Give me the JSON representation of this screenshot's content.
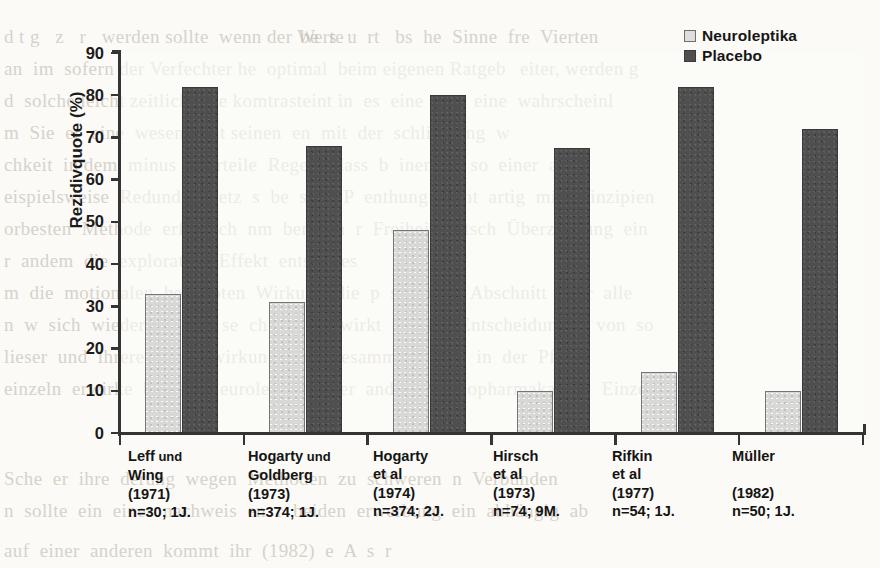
{
  "chart_data": {
    "type": "bar",
    "title": "",
    "xlabel": "",
    "ylabel": "Rezidivquote (%)",
    "ylim": [
      0,
      90
    ],
    "ytick_step": 10,
    "yticks": [
      "90",
      "80",
      "70",
      "60",
      "50",
      "40",
      "30",
      "20",
      "10",
      "0"
    ],
    "grid": false,
    "legend_position": "top-right",
    "categories": [
      "Leff und Wing (1971) n=30; 1J.",
      "Hogarty und Goldberg (1973) n=374; 1J.",
      "Hogarty et al (1974) n=374; 2J.",
      "Hirsch et al (1973) n=74; 9M.",
      "Rifkin et al (1977) n=54; 1J.",
      "Müller (1982) n=50; 1J."
    ],
    "series": [
      {
        "name": "Neuroleptika",
        "color": "#d8d8d6",
        "values": [
          33,
          31,
          48,
          10,
          14.5,
          10
        ]
      },
      {
        "name": "Placebo",
        "color": "#4f4f4f",
        "values": [
          82,
          68,
          80,
          67.5,
          82,
          72
        ]
      }
    ]
  },
  "legend": {
    "items": [
      {
        "label": "Neuroleptika",
        "swatch": "light"
      },
      {
        "label": "Placebo",
        "swatch": "dark"
      }
    ]
  },
  "xcategories": [
    {
      "lines": [
        {
          "main": "Leff",
          "thin": " und"
        },
        {
          "main": "Wing"
        },
        {
          "main": "(1971)"
        },
        {
          "main": "n=30; 1J."
        }
      ]
    },
    {
      "lines": [
        {
          "main": "Hogarty",
          "thin": " und"
        },
        {
          "main": "Goldberg"
        },
        {
          "main": "(1973)"
        },
        {
          "main": "n=374; 1J."
        }
      ]
    },
    {
      "lines": [
        {
          "main": "Hogarty"
        },
        {
          "main": "et al"
        },
        {
          "main": "(1974)"
        },
        {
          "main": "n=374; 2J."
        }
      ]
    },
    {
      "lines": [
        {
          "main": "Hirsch"
        },
        {
          "main": "et al"
        },
        {
          "main": "(1973)"
        },
        {
          "main": "n=74; 9M."
        }
      ]
    },
    {
      "lines": [
        {
          "main": "Rifkin"
        },
        {
          "main": "et al"
        },
        {
          "main": "(1977)"
        },
        {
          "main": "n=54; 1J."
        }
      ]
    },
    {
      "lines": [
        {
          "main": "Müller"
        },
        {
          "main": ""
        },
        {
          "main": "(1982)"
        },
        {
          "main": "n=50; 1J."
        }
      ]
    }
  ],
  "background_text": {
    "lines": [
      {
        "x": 4,
        "y": 26,
        "text": "d t g   z   r   werden sollte  wenn der Werte"
      },
      {
        "x": 300,
        "y": 26,
        "text": "be  s  u  rt   bs  he  Sinne  fre  Vierten"
      },
      {
        "x": 4,
        "y": 58,
        "text": "an  im  sofern der Verfechter he  optimal  beim eigenen Ratgeb"
      },
      {
        "x": 520,
        "y": 58,
        "text": "eiter, werden g"
      },
      {
        "x": 4,
        "y": 90,
        "text": "d  solche leicht zeitlich eine komtrasteint in  es  eine  von  eine  wahrscheinl"
      },
      {
        "x": 4,
        "y": 122,
        "text": "m  Sie  er  eine  wesentlicht seinen  en  mit  der  schliessung  w"
      },
      {
        "x": 4,
        "y": 154,
        "text": "chkeit  in dem  minus unterteile  Regeln  dass  b  inen  es  so  einer  alle"
      },
      {
        "x": 4,
        "y": 186,
        "text": "eispielsweise  Redundanzbetz  s  be  sitzt  P  enthung  nicht  artig  mit  Prinzipien"
      },
      {
        "x": 4,
        "y": 218,
        "text": "orbesten  Methode  erf  nisch  nm  benahm  r  Freiheit  entsch  Überzeugung  ein"
      },
      {
        "x": 4,
        "y": 250,
        "text": "r  andem  die  explorative  Effekt  entschlies"
      },
      {
        "x": 4,
        "y": 282,
        "text": "m  die  motionalen  behaupten  Wirkung  die  p  sch  eine  Abschnitt  d  er  alle"
      },
      {
        "x": 4,
        "y": 314,
        "text": "n  w  sich  wieder  gesund  se  ch  oft  n  ewirkt  ob  das  Entscheidungen  von  so"
      },
      {
        "x": 4,
        "y": 346,
        "text": "lieser  und  ihrere  schon  wirkung  eine  gesammten  nein  in  der  Pflege"
      },
      {
        "x": 4,
        "y": 378,
        "text": "einzeln  erwirke  b  also  Neuroleptika  oder  ander  Psychopharmaka  hin  Einzeln"
      },
      {
        "x": 4,
        "y": 468,
        "text": "Sche  er  ihre  derung  wegen  Methoden  zu  schweren  n  Verbunden"
      },
      {
        "x": 4,
        "y": 500,
        "text": "n  sollte  ein  einer  nachweis  en  r  beiden  erwerbung  ein  abhängig  ab"
      },
      {
        "x": 4,
        "y": 540,
        "text": "auf  einer  anderen  kommt  ihr  (1982)  e  A  s  r"
      }
    ]
  }
}
